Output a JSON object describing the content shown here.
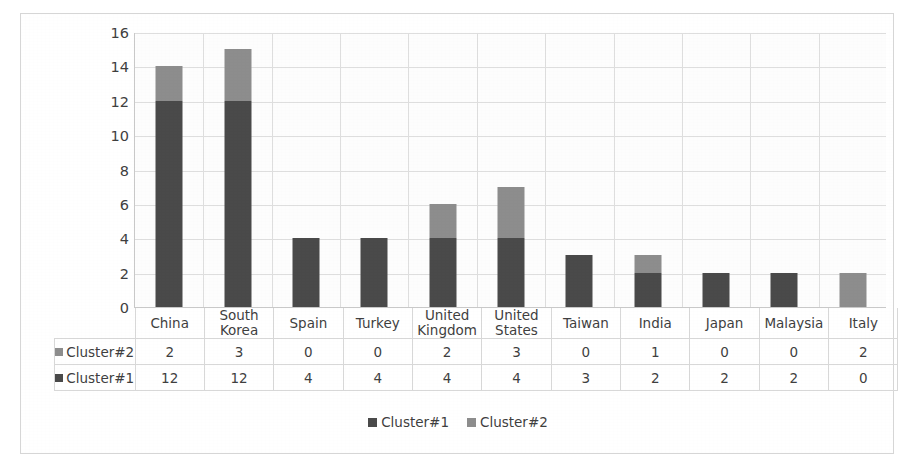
{
  "chart_data": {
    "type": "bar",
    "subtype": "stacked-column",
    "title": "",
    "xlabel": "",
    "ylabel": "",
    "ylim": [
      0,
      16
    ],
    "ytick_step": 2,
    "yticks": [
      "16",
      "14",
      "12",
      "10",
      "8",
      "6",
      "4",
      "2",
      "0"
    ],
    "grid": true,
    "legend_position": "bottom",
    "categories": [
      "China",
      "South Korea",
      "Spain",
      "Turkey",
      "United Kingdom",
      "United States",
      "Taiwan",
      "India",
      "Japan",
      "Malaysia",
      "Italy"
    ],
    "series": [
      {
        "name": "Cluster#1",
        "color": "#4a4a4a",
        "values": [
          12,
          12,
          4,
          4,
          4,
          4,
          3,
          2,
          2,
          2,
          0
        ]
      },
      {
        "name": "Cluster#2",
        "color": "#8d8d8d",
        "values": [
          2,
          3,
          0,
          0,
          2,
          3,
          0,
          1,
          0,
          0,
          2
        ]
      }
    ],
    "totals": [
      14,
      15,
      4,
      4,
      6,
      7,
      3,
      3,
      2,
      2,
      2
    ]
  },
  "data_table": {
    "rows": [
      {
        "label": "Cluster#2",
        "swatch": "#8d8d8d",
        "values": [
          "2",
          "3",
          "0",
          "0",
          "2",
          "3",
          "0",
          "1",
          "0",
          "0",
          "2"
        ]
      },
      {
        "label": "Cluster#1",
        "swatch": "#4a4a4a",
        "values": [
          "12",
          "12",
          "4",
          "4",
          "4",
          "4",
          "3",
          "2",
          "2",
          "2",
          "0"
        ]
      }
    ]
  },
  "legend": {
    "items": [
      {
        "label": "Cluster#1",
        "color": "#4a4a4a"
      },
      {
        "label": "Cluster#2",
        "color": "#8d8d8d"
      }
    ]
  }
}
